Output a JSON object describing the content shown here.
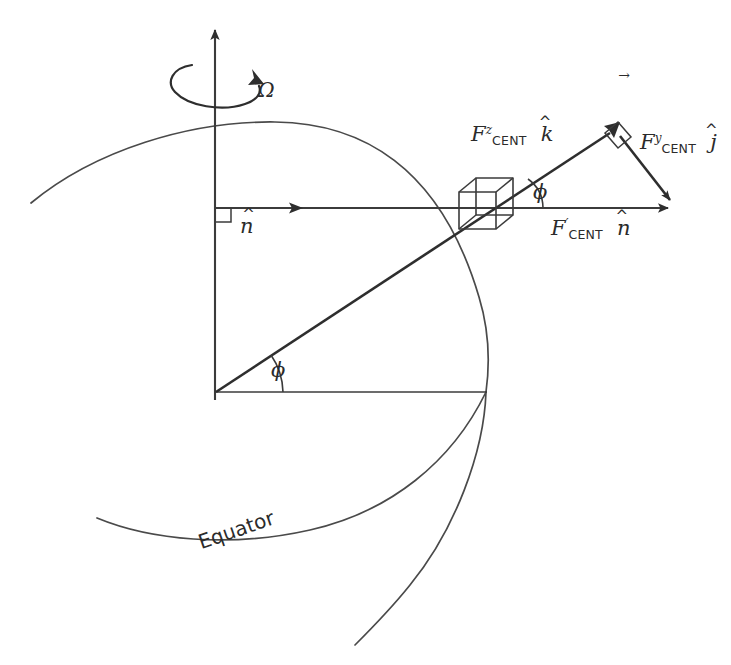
{
  "figure": {
    "domain": "diagram",
    "background_color": "#ffffff",
    "line_color": "#3b3b3b",
    "vector_color": "#2e2e2e"
  },
  "labels": {
    "omega": {
      "text": "Ω",
      "vector_mark": "→",
      "meaning": "angular-velocity-vector"
    },
    "n_hat_axis": {
      "base": "n",
      "hat": "^",
      "meaning": "local-normal-unit-vector"
    },
    "f_cent_z": {
      "base": "F",
      "superscript": "z",
      "subscript": "CENT",
      "unit_base": "k",
      "unit_hat": "^",
      "meaning": "z-component-of-centrifugal-force"
    },
    "f_cent_y": {
      "base": "F",
      "superscript": "y",
      "subscript": "CENT",
      "unit_base": "j",
      "unit_hat": "^",
      "meaning": "y-component-of-centrifugal-force"
    },
    "f_cent_prime": {
      "base": "F",
      "superscript": "′",
      "subscript": "CENT",
      "unit_base": "n",
      "unit_hat": "^",
      "meaning": "total-centrifugal-force-along-normal"
    },
    "phi_upper": {
      "text": "ϕ",
      "meaning": "latitude-angle-at-particle"
    },
    "phi_lower": {
      "text": "ϕ",
      "meaning": "latitude-angle-at-center"
    },
    "equator": {
      "text": "Equator",
      "meaning": "equator-curve-label"
    }
  },
  "geometry": {
    "origin": {
      "x": 215,
      "y": 392
    },
    "rotation_axis_top": {
      "x": 215,
      "y": 22
    },
    "equator_point": {
      "x": 486,
      "y": 392
    },
    "cube_center": {
      "x": 484,
      "y": 207
    },
    "horizontal_arrow_end": {
      "x": 676,
      "y": 208
    },
    "resultant_apex": {
      "x": 614,
      "y": 128
    },
    "globe_radius": 272,
    "latitude_degrees": 35
  }
}
